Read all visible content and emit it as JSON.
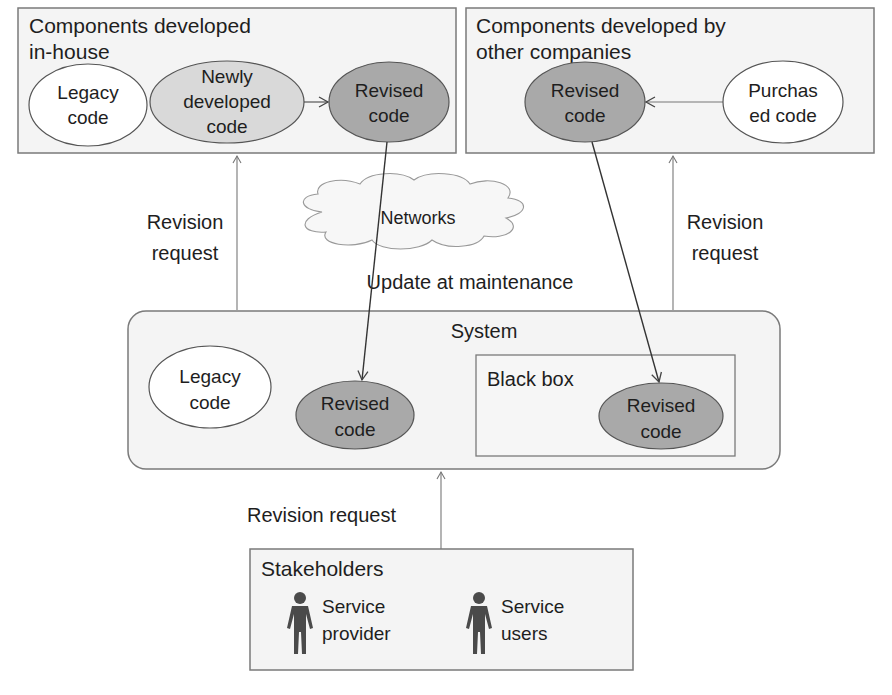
{
  "diagram": {
    "in_house": {
      "title_line1": "Components developed",
      "title_line2": "in-house",
      "legacy": {
        "line1": "Legacy",
        "line2": "code"
      },
      "newly": {
        "line1": "Newly",
        "line2": "developed",
        "line3": "code"
      },
      "revised": {
        "line1": "Revised",
        "line2": "code"
      }
    },
    "other_companies": {
      "title_line1": "Components developed by",
      "title_line2": "other companies",
      "revised": {
        "line1": "Revised",
        "line2": "code"
      },
      "purchased": {
        "line1": "Purchas",
        "line2": "ed code"
      }
    },
    "left_request": {
      "line1": "Revision",
      "line2": "request"
    },
    "right_request": {
      "line1": "Revision",
      "line2": "request"
    },
    "networks": "Networks",
    "update_label": "Update at maintenance",
    "system": {
      "title": "System",
      "legacy": {
        "line1": "Legacy",
        "line2": "code"
      },
      "revised": {
        "line1": "Revised",
        "line2": "code"
      },
      "black_box": {
        "title": "Black box",
        "revised": {
          "line1": "Revised",
          "line2": "code"
        }
      }
    },
    "bottom_request": "Revision request",
    "stakeholders": {
      "title": "Stakeholders",
      "provider": {
        "line1": "Service",
        "line2": "provider"
      },
      "users": {
        "line1": "Service",
        "line2": "users"
      }
    },
    "colors": {
      "box_fill": "#f4f4f4",
      "box_stroke": "#777777",
      "light_node": "#d9d9d9",
      "dark_node": "#a9a9a9",
      "white_node": "#ffffff",
      "person": "#4a4a4a"
    }
  }
}
